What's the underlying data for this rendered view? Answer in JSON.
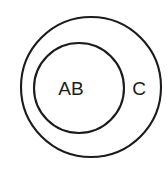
{
  "diagram": {
    "type": "euler-nested-circles",
    "background_color": "#ffffff",
    "stroke_color": "#1b1b1b",
    "label_color": "#1b1b1b",
    "outer": {
      "label": "C",
      "label_name": "outer-region-label",
      "cx": 91,
      "cy": 87,
      "r": 70,
      "stroke_width": 2.1,
      "label_x": 139,
      "label_y": 90,
      "label_font_size": 19
    },
    "inner": {
      "label": "AB",
      "label_name": "inner-region-label",
      "cx": 79,
      "cy": 88,
      "r": 45,
      "stroke_width": 2.1,
      "label_x": 71,
      "label_y": 90,
      "label_font_size": 19
    }
  }
}
